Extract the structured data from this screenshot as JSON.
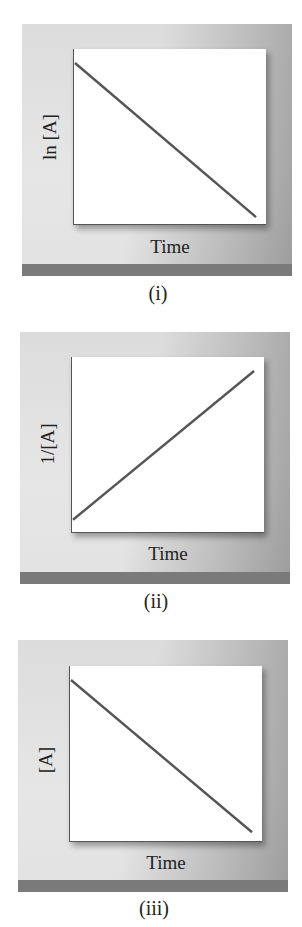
{
  "chart_data": [
    {
      "type": "line",
      "caption": "(i)",
      "xlabel": "Time",
      "ylabel": "ln [A]",
      "title": "",
      "grid": false,
      "ticks": false,
      "series": [
        {
          "name": "ln [A] vs Time",
          "x": [
            0,
            1
          ],
          "y": [
            0.92,
            0.04
          ]
        }
      ],
      "trend": "linear decreasing",
      "xlim": [
        0,
        1
      ],
      "ylim": [
        0,
        1
      ]
    },
    {
      "type": "line",
      "caption": "(ii)",
      "xlabel": "Time",
      "ylabel": "1/[A]",
      "title": "",
      "grid": false,
      "ticks": false,
      "series": [
        {
          "name": "1/[A] vs Time",
          "x": [
            0,
            1
          ],
          "y": [
            0.07,
            0.92
          ]
        }
      ],
      "trend": "linear increasing",
      "xlim": [
        0,
        1
      ],
      "ylim": [
        0,
        1
      ]
    },
    {
      "type": "line",
      "caption": "(iii)",
      "xlabel": "Time",
      "ylabel": "[A]",
      "title": "",
      "grid": false,
      "ticks": false,
      "series": [
        {
          "name": "[A] vs Time",
          "x": [
            0,
            1
          ],
          "y": [
            0.92,
            0.05
          ]
        }
      ],
      "trend": "linear decreasing",
      "xlim": [
        0,
        1
      ],
      "ylim": [
        0,
        1
      ]
    }
  ],
  "colors": {
    "line": "#555555",
    "frame": "#e0e0e0",
    "bar": "#7a7a7a",
    "plot_bg": "#ffffff"
  }
}
